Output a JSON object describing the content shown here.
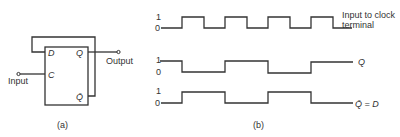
{
  "circuit": {
    "caption": "(a)",
    "pins": {
      "d": "D",
      "q": "Q",
      "c": "C",
      "qbar": "Q̄"
    },
    "input_label": "Input",
    "output_label": "Output"
  },
  "waveforms": {
    "caption": "(b)",
    "clock": {
      "label_line1": "Input to clock",
      "label_line2": "terminal",
      "high": "1",
      "low": "0"
    },
    "q": {
      "label": "Q",
      "high": "1",
      "low": "0"
    },
    "qbar": {
      "label": "Q̄ = D",
      "high": "1",
      "low": "0"
    }
  },
  "colors": {
    "line": "#333333",
    "background": "#ffffff"
  }
}
